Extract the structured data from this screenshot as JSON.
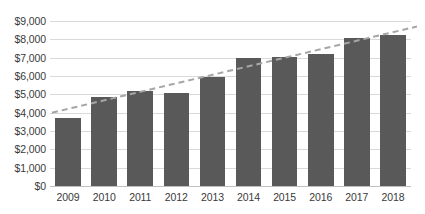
{
  "chart_data": {
    "type": "bar",
    "title": "",
    "xlabel": "",
    "ylabel": "",
    "categories": [
      "2009",
      "2010",
      "2011",
      "2012",
      "2013",
      "2014",
      "2015",
      "2016",
      "2017",
      "2018"
    ],
    "values": [
      3700,
      4850,
      5200,
      5100,
      5950,
      7000,
      7050,
      7200,
      8100,
      8250
    ],
    "ylim": [
      0,
      9000
    ],
    "ytick_step": 1000,
    "ytick_labels": [
      "$9,000",
      "$8,000",
      "$7,000",
      "$6,000",
      "$5,000",
      "$4,000",
      "$3,000",
      "$2,000",
      "$1,000",
      "$0"
    ],
    "ytick_values": [
      9000,
      8000,
      7000,
      6000,
      5000,
      4000,
      3000,
      2000,
      1000,
      0
    ],
    "value_prefix": "$",
    "grid": true,
    "grid_axis": "y",
    "legend": false,
    "legend_position": "none",
    "series": [
      {
        "name": "bars",
        "type": "bar",
        "color": "#595959",
        "values": [
          3700,
          4850,
          5200,
          5100,
          5950,
          7000,
          7050,
          7200,
          8100,
          8250
        ]
      },
      {
        "name": "trendline",
        "type": "line",
        "style": "dashed",
        "color": "#a6a6a6",
        "start_value": 4000,
        "end_value": 8700
      }
    ],
    "annotations": []
  },
  "caption": {
    "text": ""
  },
  "colors": {
    "bar": "#595959",
    "trendline": "#a6a6a6",
    "gridline": "#d9d9d9",
    "baseline": "#bfbfbf",
    "tick_text": "#3a3a3a",
    "background": "#ffffff"
  }
}
